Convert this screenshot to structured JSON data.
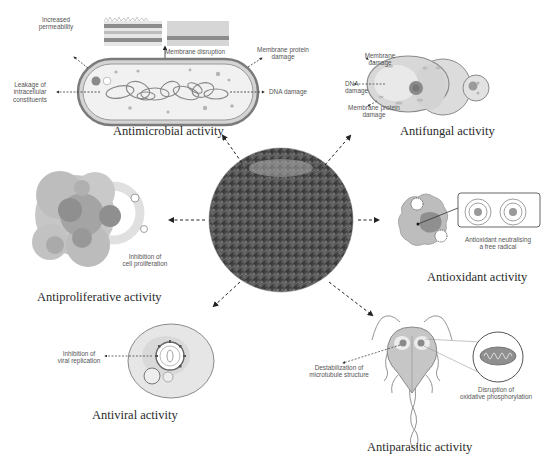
{
  "figure": {
    "center": {
      "name": "plant-extract-image"
    },
    "panels": {
      "antimicrobial": {
        "title": "Antimicrobial activity",
        "labels": {
          "increased_permeability": "Increased\npermeability",
          "membrane_disruption": "Membrane disruption",
          "membrane_protein_damage": "Membrane protein\ndamage",
          "leakage": "Leakage of\nintracellular\nconstituents",
          "dna_damage": "DNA damage"
        }
      },
      "antifungal": {
        "title": "Antifungal activity",
        "labels": {
          "membrane_damage": "Membrane\ndamage",
          "dna_damage": "DNA damage",
          "membrane_protein_damage": "Membrane protein\ndamage"
        }
      },
      "antiproliferative": {
        "title": "Antiproliferative activity",
        "labels": {
          "inhibition": "Inhibition of\ncell proliferation"
        }
      },
      "antioxidant": {
        "title": "Antioxidant activity",
        "labels": {
          "neutralising": "Antioxidant neutralising\na free radical"
        }
      },
      "antiviral": {
        "title": "Antiviral activity",
        "labels": {
          "inhibition": "Inhibition of\nviral replication"
        }
      },
      "antiparasitic": {
        "title": "Antiparasitic activity",
        "labels": {
          "destabilization": "Destabilization of\nmicrotubule structure",
          "disruption": "Disruption of\noxidative phosphorylation"
        }
      }
    }
  }
}
